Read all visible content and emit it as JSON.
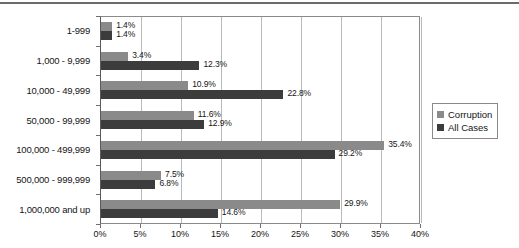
{
  "chart_data": {
    "type": "bar",
    "orientation": "horizontal",
    "title": "",
    "xlabel": "",
    "ylabel": "",
    "xlim": [
      0,
      40
    ],
    "xunit": "%",
    "grid": true,
    "legend_position": "right",
    "categories": [
      "1-999",
      "1,000 - 9,999",
      "10,000 - 49,999",
      "50,000 - 99,999",
      "100,000 - 499,999",
      "500,000 - 999,999",
      "1,000,000 and up"
    ],
    "xticks": [
      0,
      5,
      10,
      15,
      20,
      25,
      30,
      35,
      40
    ],
    "xticklabels": [
      "0%",
      "5%",
      "10%",
      "15%",
      "20%",
      "25%",
      "30%",
      "35%",
      "40%"
    ],
    "series": [
      {
        "name": "Corruption",
        "color": "#8a8a8a",
        "values": [
          1.4,
          3.4,
          10.9,
          11.6,
          35.4,
          7.5,
          29.9
        ],
        "labels": [
          "1.4%",
          "3.4%",
          "10.9%",
          "11.6%",
          "35.4%",
          "7.5%",
          "29.9%"
        ]
      },
      {
        "name": "All Cases",
        "color": "#3c3c3c",
        "values": [
          1.4,
          12.3,
          22.8,
          12.9,
          29.2,
          6.8,
          14.6
        ],
        "labels": [
          "1.4%",
          "12.3%",
          "22.8%",
          "12.9%",
          "29.2%",
          "6.8%",
          "14.6%"
        ]
      }
    ]
  },
  "legend": {
    "items": [
      {
        "label": "Corruption",
        "color": "#8a8a8a"
      },
      {
        "label": "All Cases",
        "color": "#3c3c3c"
      }
    ]
  }
}
